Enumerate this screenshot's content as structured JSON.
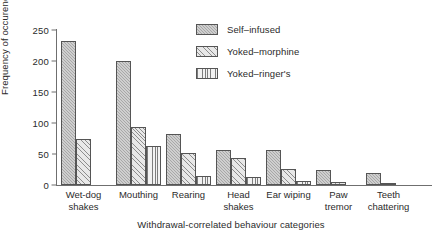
{
  "chart_data": {
    "type": "bar",
    "title": "",
    "xlabel": "Withdrawal-correlated behaviour categories",
    "ylabel": "Frequency of occurence",
    "ylim": [
      0,
      250
    ],
    "yticks": [
      0,
      50,
      100,
      150,
      200,
      250
    ],
    "grid": false,
    "legend_position": "top-right-inside",
    "categories": [
      "Wet-dog\nshakes",
      "Mouthing",
      "Rearing",
      "Head\nshakes",
      "Ear wiping",
      "Paw\ntremor",
      "Teeth\nchattering"
    ],
    "series": [
      {
        "name": "Self–infused",
        "values": [
          232,
          200,
          83,
          57,
          57,
          25,
          19
        ]
      },
      {
        "name": "Yoked–morphine",
        "values": [
          75,
          94,
          52,
          43,
          26,
          5,
          3
        ]
      },
      {
        "name": "Yoked–ringer's",
        "values": [
          0,
          63,
          14,
          13,
          7,
          0,
          0
        ]
      }
    ]
  },
  "legend": {
    "items": [
      {
        "label": "Self–infused"
      },
      {
        "label": "Yoked–morphine"
      },
      {
        "label": "Yoked–ringer's"
      }
    ]
  },
  "colors": {
    "series1": "#a8a8a8",
    "series2": "#e8e8e8",
    "series3": "#f2f2f2",
    "axis": "#6f6f6f",
    "text": "#2b2b2b",
    "background": "#ffffff"
  }
}
